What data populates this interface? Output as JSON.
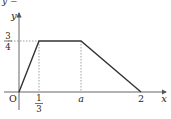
{
  "graph": {
    "top_clipped_text": "y =",
    "axis_labels": {
      "x": "x",
      "y": "y",
      "origin": "O"
    },
    "y_tick": {
      "numerator": "3",
      "denominator": "4"
    },
    "x_ticks": [
      {
        "id": "one_third",
        "numerator": "1",
        "denominator": "3"
      },
      {
        "id": "a",
        "label": "a"
      },
      {
        "id": "two",
        "label": "2"
      }
    ],
    "polyline_points": [
      {
        "x": 0,
        "y": 0
      },
      {
        "x": "1/3",
        "y": "3/4"
      },
      {
        "x": "a",
        "y": "3/4"
      },
      {
        "x": 2,
        "y": 0
      }
    ],
    "colors": {
      "line": "#333333",
      "axis": "#555555",
      "dashed": "#777777"
    }
  }
}
